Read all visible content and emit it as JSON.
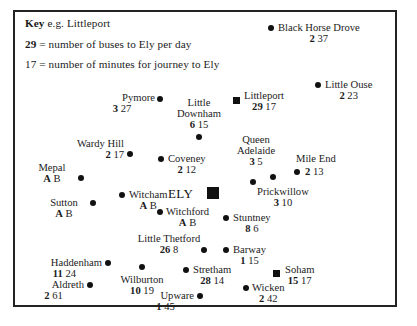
{
  "figure": {
    "type": "annotated-map",
    "region": "Ely area bus services map"
  },
  "key": {
    "title": "Key",
    "example_prefix": "e.g.",
    "example_place": "Littleport",
    "buses_value": "29",
    "buses_desc": "= number of buses to Ely per day",
    "minutes_value": "17",
    "minutes_desc": "= number of minutes for journey to Ely"
  },
  "center": {
    "label": "ELY",
    "marker": "square-large"
  },
  "places": [
    {
      "name": "Black Horse Drove",
      "buses": "2",
      "minutes": "37",
      "marker": "dot"
    },
    {
      "name": "Little Ouse",
      "buses": "2",
      "minutes": "23",
      "marker": "dot"
    },
    {
      "name": "Littleport",
      "buses": "29",
      "minutes": "17",
      "marker": "square-small"
    },
    {
      "name": "Pymore",
      "buses": "3",
      "minutes": "27",
      "marker": "dot"
    },
    {
      "name": "Little Downham",
      "buses": "6",
      "minutes": "15",
      "marker": "dot"
    },
    {
      "name": "Wardy Hill",
      "buses": "2",
      "minutes": "17",
      "marker": "dot"
    },
    {
      "name": "Coveney",
      "buses": "2",
      "minutes": "12",
      "marker": "dot"
    },
    {
      "name": "Queen Adelaide",
      "buses": "3",
      "minutes": "5",
      "marker": "dot"
    },
    {
      "name": "Mile End",
      "buses": "2",
      "minutes": "13",
      "marker": "dot"
    },
    {
      "name": "Prickwillow",
      "buses": "3",
      "minutes": "10",
      "marker": "dot"
    },
    {
      "name": "Mepal",
      "buses": "A",
      "minutes": "B",
      "marker": "dot"
    },
    {
      "name": "Witcham",
      "buses": "A",
      "minutes": "B",
      "marker": "dot"
    },
    {
      "name": "Sutton",
      "buses": "A",
      "minutes": "B",
      "marker": "dot"
    },
    {
      "name": "Witchford",
      "buses": "A",
      "minutes": "B",
      "marker": "dot"
    },
    {
      "name": "Stuntney",
      "buses": "8",
      "minutes": "6",
      "marker": "dot"
    },
    {
      "name": "Little Thetford",
      "buses": "26",
      "minutes": "8",
      "marker": "dot"
    },
    {
      "name": "Barway",
      "buses": "1",
      "minutes": "15",
      "marker": "dot"
    },
    {
      "name": "Haddenham",
      "buses": "11",
      "minutes": "24",
      "marker": "dot"
    },
    {
      "name": "Wilburton",
      "buses": "10",
      "minutes": "19",
      "marker": "dot"
    },
    {
      "name": "Stretham",
      "buses": "28",
      "minutes": "14",
      "marker": "dot"
    },
    {
      "name": "Soham",
      "buses": "15",
      "minutes": "17",
      "marker": "square-small"
    },
    {
      "name": "Aldreth",
      "buses": "2",
      "minutes": "61",
      "marker": "dot"
    },
    {
      "name": "Upware",
      "buses": "1",
      "minutes": "45",
      "marker": "dot"
    },
    {
      "name": "Wicken",
      "buses": "2",
      "minutes": "42",
      "marker": "dot"
    }
  ]
}
